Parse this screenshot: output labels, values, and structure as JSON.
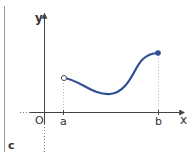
{
  "figure": {
    "panel_label": "c",
    "axis_labels": {
      "x": "x",
      "y": "y",
      "origin": "O"
    },
    "tick_labels": {
      "a": "a",
      "b": "b"
    },
    "colors": {
      "curve": "#2f4f95",
      "axis": "#444444",
      "border": "#9a9a9a",
      "guide": "#b8b8b8",
      "text": "#333333"
    },
    "endpoints": {
      "left": {
        "at": "a",
        "style": "open"
      },
      "right": {
        "at": "b",
        "style": "closed"
      }
    }
  }
}
